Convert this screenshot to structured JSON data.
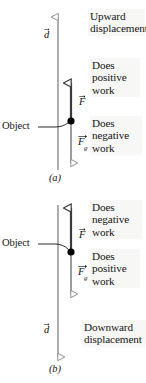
{
  "figure": {
    "colors": {
      "displacement_arrow": "#9a9a9a",
      "force_arrow": "#3a3a3a",
      "gravity_arrow": "#8d8d8d",
      "object_dot": "#000000",
      "text": "#161616",
      "text_block_bg": "#f7f7f5"
    }
  },
  "panel_a": {
    "caption": "(a)",
    "object_label": "Object",
    "vectors": {
      "displacement": {
        "symbol": "d",
        "direction": "up",
        "style": "hollow-head"
      },
      "applied_force": {
        "symbol": "F",
        "direction": "up",
        "style": "hollow-head"
      },
      "gravity_force": {
        "symbol": "F",
        "subscript": "g",
        "direction": "down",
        "style": "hollow-head"
      }
    },
    "annotations": {
      "displacement_text": "Upward\ndisplacement",
      "displacement_line1": "Upward",
      "displacement_line2": "displacement",
      "force_line1": "Does",
      "force_line2": "positive",
      "force_line3": "work",
      "gravity_line1": "Does",
      "gravity_line2": "negative",
      "gravity_line3": "work"
    }
  },
  "panel_b": {
    "caption": "(b)",
    "object_label": "Object",
    "vectors": {
      "displacement": {
        "symbol": "d",
        "direction": "down",
        "style": "hollow-head"
      },
      "applied_force": {
        "symbol": "F",
        "direction": "up",
        "style": "hollow-head"
      },
      "gravity_force": {
        "symbol": "F",
        "subscript": "g",
        "direction": "down",
        "style": "hollow-head"
      }
    },
    "annotations": {
      "displacement_line1": "Downward",
      "displacement_line2": "displacement",
      "force_line1": "Does",
      "force_line2": "negative",
      "force_line3": "work",
      "gravity_line1": "Does",
      "gravity_line2": "positive",
      "gravity_line3": "work"
    }
  }
}
